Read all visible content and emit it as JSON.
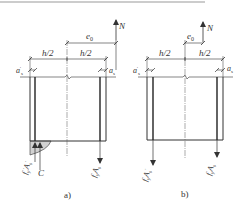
{
  "figures": [
    {
      "id": "a",
      "caption": "a)",
      "labels": {
        "force": "N",
        "eccentricity": "e",
        "eccentricity_sub": "0",
        "half_left": "h/2",
        "half_right": "h/2",
        "cover_left": "a",
        "cover_left_sub": "s",
        "cover_left_prime": "'",
        "cover_right": "a",
        "cover_right_sub": "s",
        "steel_left": "f",
        "steel_left_sub": "y",
        "steel_left_prime": "'",
        "steel_left_A": "A",
        "steel_left_A_sub": "s",
        "steel_left_A_prime": "'",
        "steel_right": "f",
        "steel_right_sub": "y",
        "steel_right_A": "A",
        "steel_right_A_sub": "s",
        "concrete": "C"
      }
    },
    {
      "id": "b",
      "caption": "b)",
      "labels": {
        "force": "N",
        "eccentricity": "e",
        "eccentricity_sub": "0",
        "half_left": "h/2",
        "half_right": "h/2",
        "cover_left": "a",
        "cover_left_sub": "s",
        "cover_left_prime": "'",
        "cover_right": "a",
        "cover_right_sub": "s",
        "steel_left": "f",
        "steel_left_sub": "y",
        "steel_left_A": "A",
        "steel_left_A_sub": "s",
        "steel_left_A_prime": "'",
        "steel_right": "f",
        "steel_right_sub": "y",
        "steel_right_A": "A",
        "steel_right_A_sub": "s"
      }
    }
  ],
  "colors": {
    "line": "#333333",
    "thin": "#666666",
    "background": "#ffffff"
  }
}
